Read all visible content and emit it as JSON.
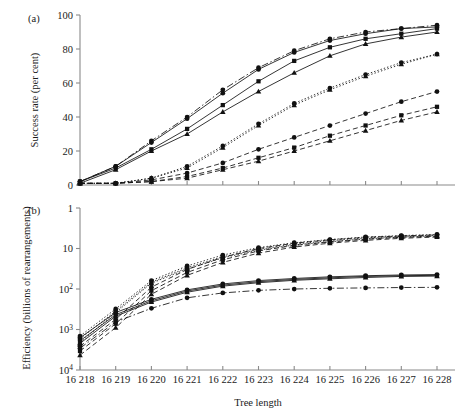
{
  "figure": {
    "panels": [
      {
        "tag": "(a)",
        "ylabel": "Success rate (per cent)"
      },
      {
        "tag": "(b)",
        "ylabel": "Efficiency (billions of rearrangements)"
      }
    ],
    "xlabel": "Tree length"
  },
  "chart_data": [
    {
      "type": "line",
      "panel": "(a)",
      "title": "",
      "xlabel": "Tree length",
      "ylabel": "Success rate (per cent)",
      "x": [
        16218,
        16219,
        16220,
        16221,
        16222,
        16223,
        16224,
        16225,
        16226,
        16227,
        16228
      ],
      "xticklabels": [
        "16 218",
        "16 219",
        "16 220",
        "16 221",
        "16 222",
        "16 223",
        "16 224",
        "16 225",
        "16 226",
        "16 227",
        "16 228"
      ],
      "ylim": [
        0,
        100
      ],
      "yticks": [
        0,
        20,
        40,
        60,
        80,
        100
      ],
      "yticklabels": [
        "0",
        "20",
        "40",
        "60",
        "80",
        "100"
      ],
      "grid": false,
      "legend": "none",
      "series": [
        {
          "name": "circle-dashdot-upper",
          "marker": "circle",
          "linestyle": "dashdot",
          "values": [
            2,
            11,
            26,
            40,
            56,
            69,
            79,
            86,
            90,
            92,
            94
          ]
        },
        {
          "name": "square-solid-upper",
          "marker": "square",
          "linestyle": "solid",
          "values": [
            2,
            10,
            21,
            33,
            47,
            61,
            73,
            81,
            86,
            89,
            92
          ]
        },
        {
          "name": "triangle-solid-upper",
          "marker": "triangle",
          "linestyle": "solid",
          "values": [
            1,
            9,
            20,
            30,
            43,
            55,
            66,
            76,
            83,
            87,
            90
          ]
        },
        {
          "name": "circle-solid-mid",
          "marker": "circle",
          "linestyle": "solid",
          "values": [
            2,
            11,
            25,
            39,
            54,
            68,
            78,
            85,
            89,
            92,
            93
          ]
        },
        {
          "name": "circle-dotted-lower",
          "marker": "circle",
          "linestyle": "dotted",
          "values": [
            1,
            1,
            4,
            11,
            23,
            36,
            48,
            57,
            65,
            72,
            77
          ]
        },
        {
          "name": "triangle-dotted-lower",
          "marker": "triangle",
          "linestyle": "dotted",
          "values": [
            1,
            1,
            4,
            10,
            22,
            35,
            47,
            56,
            64,
            71,
            77
          ]
        },
        {
          "name": "circle-dashed-low",
          "marker": "circle",
          "linestyle": "dashed",
          "values": [
            1,
            1,
            3,
            7,
            13,
            21,
            28,
            35,
            42,
            49,
            55
          ]
        },
        {
          "name": "square-dashed-low",
          "marker": "square",
          "linestyle": "dashed",
          "values": [
            1,
            1,
            2,
            5,
            10,
            16,
            22,
            29,
            35,
            41,
            46
          ]
        },
        {
          "name": "triangle-dashed-low",
          "marker": "triangle",
          "linestyle": "dashed",
          "values": [
            1,
            1,
            2,
            4,
            9,
            14,
            20,
            26,
            32,
            38,
            43
          ]
        }
      ]
    },
    {
      "type": "line",
      "panel": "(b)",
      "title": "",
      "xlabel": "Tree length",
      "ylabel": "Efficiency (billions of rearrangements)",
      "x": [
        16218,
        16219,
        16220,
        16221,
        16222,
        16223,
        16224,
        16225,
        16226,
        16227,
        16228
      ],
      "xticklabels": [
        "16 218",
        "16 219",
        "16 220",
        "16 221",
        "16 222",
        "16 223",
        "16 224",
        "16 225",
        "16 226",
        "16 227",
        "16 228"
      ],
      "yscale": "log-inverted",
      "ylim": [
        1,
        10000
      ],
      "yticks": [
        1,
        10,
        100,
        1000,
        10000
      ],
      "yticklabels": [
        "1",
        "10",
        "10²",
        "10³",
        "10⁴"
      ],
      "grid": false,
      "legend": "none",
      "series": [
        {
          "name": "circle-dotted-top",
          "marker": "circle",
          "linestyle": "dotted",
          "values": [
            1450,
            310,
            62,
            27,
            14.5,
            9.5,
            7.2,
            6.0,
            5.2,
            4.8,
            4.5
          ]
        },
        {
          "name": "square-dotted-top",
          "marker": "square",
          "linestyle": "dotted",
          "values": [
            1700,
            350,
            68,
            30,
            16.0,
            10.5,
            7.8,
            6.4,
            5.5,
            5.0,
            4.7
          ]
        },
        {
          "name": "triangle-dotted-top",
          "marker": "triangle",
          "linestyle": "dotted",
          "values": [
            2100,
            380,
            72,
            32,
            17.0,
            11.0,
            8.2,
            6.8,
            5.8,
            5.2,
            4.9
          ]
        },
        {
          "name": "circle-dashed-top",
          "marker": "circle",
          "linestyle": "dashed",
          "values": [
            2600,
            560,
            90,
            33,
            16.5,
            10.0,
            7.4,
            6.1,
            5.3,
            4.9,
            4.6
          ]
        },
        {
          "name": "square-dashed-top",
          "marker": "square",
          "linestyle": "dashed",
          "values": [
            3400,
            720,
            110,
            39,
            19.0,
            11.5,
            8.4,
            6.9,
            5.9,
            5.3,
            5.0
          ]
        },
        {
          "name": "triangle-dashed-top",
          "marker": "triangle",
          "linestyle": "dashed",
          "values": [
            4300,
            900,
            135,
            46,
            22.0,
            13.0,
            9.2,
            7.4,
            6.3,
            5.6,
            5.2
          ]
        },
        {
          "name": "circle-solid-mid",
          "marker": "circle",
          "linestyle": "solid",
          "values": [
            1600,
            380,
            180,
            105,
            75,
            62,
            55,
            50,
            47,
            45,
            44
          ]
        },
        {
          "name": "square-solid-mid",
          "marker": "square",
          "linestyle": "solid",
          "values": [
            1900,
            430,
            195,
            112,
            80,
            66,
            58,
            53,
            49,
            47,
            46
          ]
        },
        {
          "name": "triangle-solid-mid",
          "marker": "triangle",
          "linestyle": "solid",
          "values": [
            2200,
            470,
            210,
            120,
            85,
            70,
            61,
            56,
            52,
            49,
            48
          ]
        },
        {
          "name": "circle-dashdot-bottom",
          "marker": "circle",
          "linestyle": "dashdot",
          "values": [
            2900,
            650,
            300,
            165,
            125,
            108,
            100,
            96,
            94,
            92,
            91
          ]
        }
      ]
    }
  ]
}
